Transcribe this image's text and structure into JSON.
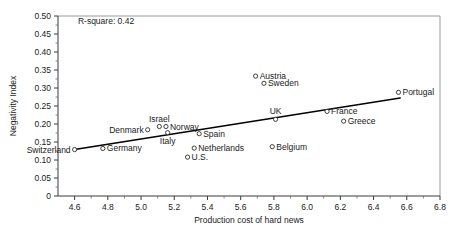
{
  "chart_data": {
    "type": "scatter",
    "title": "",
    "xlabel": "Production cost of hard news",
    "ylabel": "Negativity Index",
    "xlim": [
      4.5,
      6.8
    ],
    "ylim": [
      0.0,
      0.5
    ],
    "xticks": [
      "4.6",
      "4.8",
      "5.0",
      "5.2",
      "5.4",
      "5.6",
      "5.8",
      "6.0",
      "6.2",
      "6.4",
      "6.6",
      "6.8"
    ],
    "xtick_values": [
      4.6,
      4.8,
      5.0,
      5.2,
      5.4,
      5.6,
      5.8,
      6.0,
      6.2,
      6.4,
      6.6,
      6.8
    ],
    "yticks": [
      "0",
      "0.05",
      "0.10",
      "0.15",
      "0.20",
      "0.25",
      "0.30",
      "0.35",
      "0.40",
      "0.45",
      "0.50"
    ],
    "ytick_values": [
      0,
      0.05,
      0.1,
      0.15,
      0.2,
      0.25,
      0.3,
      0.35,
      0.4,
      0.45,
      0.5
    ],
    "grid": false,
    "legend": "none",
    "annotations": [
      {
        "text": "R-square: 0.42",
        "x": 4.62,
        "y": 0.477
      }
    ],
    "trendline": {
      "label": "linear-fit",
      "x": [
        4.6,
        6.56
      ],
      "y": [
        0.129,
        0.272
      ]
    },
    "points": [
      {
        "label": "Switzerland",
        "x": 4.6,
        "y": 0.129,
        "label_pos": "left"
      },
      {
        "label": "Germany",
        "x": 4.77,
        "y": 0.132,
        "label_pos": "right"
      },
      {
        "label": "Denmark",
        "x": 5.04,
        "y": 0.184,
        "label_pos": "left"
      },
      {
        "label": "Israel",
        "x": 5.11,
        "y": 0.193,
        "label_pos": "above"
      },
      {
        "label": "Norway",
        "x": 5.15,
        "y": 0.193,
        "label_pos": "right"
      },
      {
        "label": "Italy",
        "x": 5.16,
        "y": 0.176,
        "label_pos": "below"
      },
      {
        "label": "Spain",
        "x": 5.35,
        "y": 0.173,
        "label_pos": "right"
      },
      {
        "label": "Netherlands",
        "x": 5.32,
        "y": 0.133,
        "label_pos": "right"
      },
      {
        "label": "U.S.",
        "x": 5.28,
        "y": 0.108,
        "label_pos": "right"
      },
      {
        "label": "Austria",
        "x": 5.69,
        "y": 0.333,
        "label_pos": "right"
      },
      {
        "label": "Sweden",
        "x": 5.74,
        "y": 0.313,
        "label_pos": "right"
      },
      {
        "label": "UK",
        "x": 5.81,
        "y": 0.213,
        "label_pos": "above"
      },
      {
        "label": "Belgium",
        "x": 5.79,
        "y": 0.137,
        "label_pos": "right"
      },
      {
        "label": "France",
        "x": 6.12,
        "y": 0.235,
        "label_pos": "right"
      },
      {
        "label": "Greece",
        "x": 6.22,
        "y": 0.208,
        "label_pos": "right"
      },
      {
        "label": "Portugal",
        "x": 6.55,
        "y": 0.288,
        "label_pos": "right"
      }
    ]
  }
}
